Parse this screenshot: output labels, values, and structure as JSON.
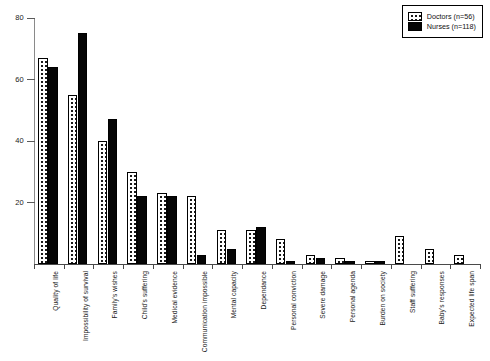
{
  "chart_data": {
    "type": "bar",
    "title": "",
    "subtitle": "",
    "xlabel": "",
    "ylabel": "",
    "ylim": [
      0,
      80
    ],
    "yticks": [
      0,
      20,
      40,
      60,
      80
    ],
    "ytick_labels": [
      "0",
      "20",
      "40",
      "60",
      "80"
    ],
    "grid": false,
    "legend_position": "top-right",
    "orientation": "vertical",
    "categories": [
      "Quality of life",
      "Impossibility of survival",
      "Family's wishes",
      "Child's suffering",
      "Medical evidence",
      "Communication impossible",
      "Mental capacity",
      "Dependance",
      "Personal conviction",
      "Severe damage",
      "Personal agenda",
      "Burden on society",
      "Staff suffering",
      "Baby's responses",
      "Expected life span"
    ],
    "series": [
      {
        "name": "Doctors (n=56)",
        "style": "dotted-white",
        "values": [
          67,
          55,
          40,
          30,
          23,
          22,
          11,
          11,
          8,
          3,
          2,
          1,
          9,
          5,
          3
        ]
      },
      {
        "name": "Nurses (n=118)",
        "style": "solid-black",
        "values": [
          64,
          75,
          47,
          22,
          22,
          3,
          5,
          12,
          1,
          2,
          1,
          1,
          0,
          0,
          0
        ]
      }
    ]
  },
  "legend": {
    "entries": [
      {
        "label": "Doctors (n=56)",
        "swatch": "dotted-white"
      },
      {
        "label": "Nurses (n=118)",
        "swatch": "solid-black"
      }
    ]
  },
  "colors": {
    "doctors_fill": "#ffffff",
    "doctors_dots": "#1a1a1a",
    "nurses_fill": "#050505",
    "axis": "#4a4a4a",
    "text": "#111111",
    "background": "#ffffff"
  }
}
